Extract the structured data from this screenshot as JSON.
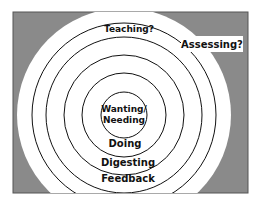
{
  "diagram": {
    "type": "concentric-circles",
    "colors": {
      "background": "#8a8a8a",
      "frame": "#555555",
      "ring_fill": "#ffffff",
      "ring_stroke": "#111111",
      "text": "#111111"
    },
    "rings": [
      {
        "id": "center",
        "label": "Wanting/\nNeeding",
        "line1": "Wanting/",
        "line2": "Needing"
      },
      {
        "id": "ring-1",
        "label": "Doing"
      },
      {
        "id": "ring-2",
        "label": "Digesting"
      },
      {
        "id": "ring-3",
        "label": "Feedback"
      },
      {
        "id": "ring-4",
        "label": "Teaching?"
      },
      {
        "id": "ring-5",
        "label": "Assessing?"
      }
    ]
  }
}
